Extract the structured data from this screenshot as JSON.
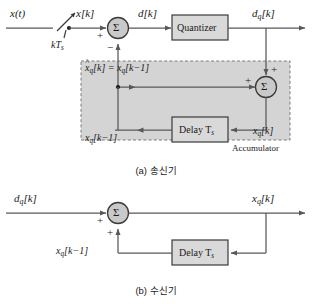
{
  "figure": {
    "kind": "block-diagram",
    "title_a": "(a) 송신기",
    "title_b": "(b) 수신기",
    "colors": {
      "line": "#58585a",
      "box_fill": "#d9d9d9",
      "box_stroke": "#3a3a3a",
      "region_fill": "#d4d4d4",
      "region_stroke": "#8a8a8a",
      "text": "#1a1a1a",
      "background": "#ffffff"
    }
  },
  "transmitter": {
    "input_label": "x(t)",
    "sampler_label": "kT",
    "sampler_label_sub": "s",
    "sampled_label": "x[k]",
    "error_label": "d[k]",
    "quantizer_label": "Quantizer",
    "quantized_out_label": "d",
    "quantized_out_sub": "q",
    "quantized_out_tail": "[k]",
    "predictor_eq_left": "x",
    "predictor_eq_left_sub": "q",
    "predictor_eq_mid": "[k] = x",
    "predictor_eq_mid_sub": "q",
    "predictor_eq_tail": "[k−1]",
    "delay_label": "Delay  T",
    "delay_label_sub": "s",
    "delayed_state_label": "x",
    "delayed_state_sub": "q",
    "delayed_state_tail": "[k−1]",
    "state_label": "x",
    "state_sub": "q",
    "state_tail": "[k]",
    "accumulator_label": "Accumulator",
    "sum1_glyph": "Σ",
    "sum2_glyph": "Σ",
    "sum1_plus": "+",
    "sum1_minus": "−",
    "sum2_plus_left": "+",
    "sum2_plus_top": "+"
  },
  "receiver": {
    "input_label": "d",
    "input_sub": "q",
    "input_tail": "[k]",
    "output_label": "x",
    "output_sub": "q",
    "output_tail": "[k]",
    "delay_label": "Delay  T",
    "delay_label_sub": "s",
    "feedback_label": "x",
    "feedback_sub": "q",
    "feedback_tail": "[k−1]",
    "sum_glyph": "Σ",
    "plus_left": "+",
    "plus_bottom": "+"
  }
}
